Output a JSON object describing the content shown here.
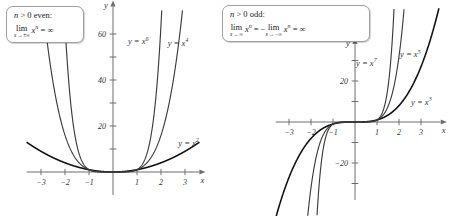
{
  "figure": {
    "callout_even": {
      "name": "n-greater-0-even",
      "line1_var": "n",
      "line1_rest": " > 0 even:",
      "lim_word": "lim",
      "lim_sub": "x → ±∞",
      "expr_var": "x",
      "expr_sup": "n",
      "expr_rest": " = ∞"
    },
    "callout_odd": {
      "name": "n-greater-0-odd",
      "line1_var": "n",
      "line1_rest": " > 0 odd:",
      "lim_word": "lim",
      "lim_sub_1": "x → ∞",
      "lim_sub_2": "x → −∞",
      "expr_var": "x",
      "expr_sup": "n",
      "mid": " = −",
      "tail": " = ∞"
    }
  },
  "chart_data": [
    {
      "type": "line",
      "id": "even-powers",
      "title": "Even powers",
      "xlabel": "x",
      "ylabel": "y",
      "xlim": [
        -3.6,
        3.6
      ],
      "ylim": [
        -10,
        72
      ],
      "xticks": [
        -3,
        -2,
        -1,
        1,
        2,
        3
      ],
      "xticklabels": [
        "−3",
        "−2",
        "−1",
        "1",
        "2",
        "3"
      ],
      "yticks": [
        20,
        40,
        60
      ],
      "yticklabels": [
        "20",
        "40",
        "60"
      ],
      "yminorticks": [
        10,
        30,
        50
      ],
      "grid": false,
      "legend": "inline-labels",
      "series": [
        {
          "name": "y = x²",
          "exponent": 2,
          "label": "y = x",
          "sup": "2",
          "label_x": 2.72,
          "label_y": 11.5,
          "weight": "thick"
        },
        {
          "name": "y = x⁴",
          "exponent": 4,
          "label": "y = x",
          "sup": "4",
          "label_x": 2.28,
          "label_y": 55.0,
          "weight": "thin"
        },
        {
          "name": "y = x⁶",
          "exponent": 6,
          "label": "y = x",
          "sup": "6",
          "label_x": 0.62,
          "label_y": 55.5,
          "weight": "thin"
        }
      ]
    },
    {
      "type": "line",
      "id": "odd-powers",
      "title": "Odd powers",
      "xlabel": "x",
      "ylabel": "y",
      "xlim": [
        -3.6,
        3.9
      ],
      "ylim": [
        -38,
        38
      ],
      "xticks": [
        -3,
        -2,
        -1,
        1,
        2,
        3
      ],
      "xticklabels": [
        "−3",
        "−2",
        "−1",
        "1",
        "2",
        "3"
      ],
      "yticks": [
        20,
        -20
      ],
      "yticklabels": [
        "20",
        "−20"
      ],
      "yminorticks": [
        10,
        -10,
        30,
        -30
      ],
      "grid": false,
      "legend": "inline-labels",
      "series": [
        {
          "name": "y = x³",
          "exponent": 3,
          "label": "y = x",
          "sup": "3",
          "label_x": 2.55,
          "label_y": 8.5,
          "weight": "thick"
        },
        {
          "name": "y = x⁵",
          "exponent": 5,
          "label": "y = x",
          "sup": "5",
          "label_x": 2.05,
          "label_y": 31.5,
          "weight": "thin"
        },
        {
          "name": "y = x⁷",
          "exponent": 7,
          "label": "y = x",
          "sup": "7",
          "label_x": 0.05,
          "label_y": 27.5,
          "weight": "thin"
        }
      ]
    }
  ]
}
